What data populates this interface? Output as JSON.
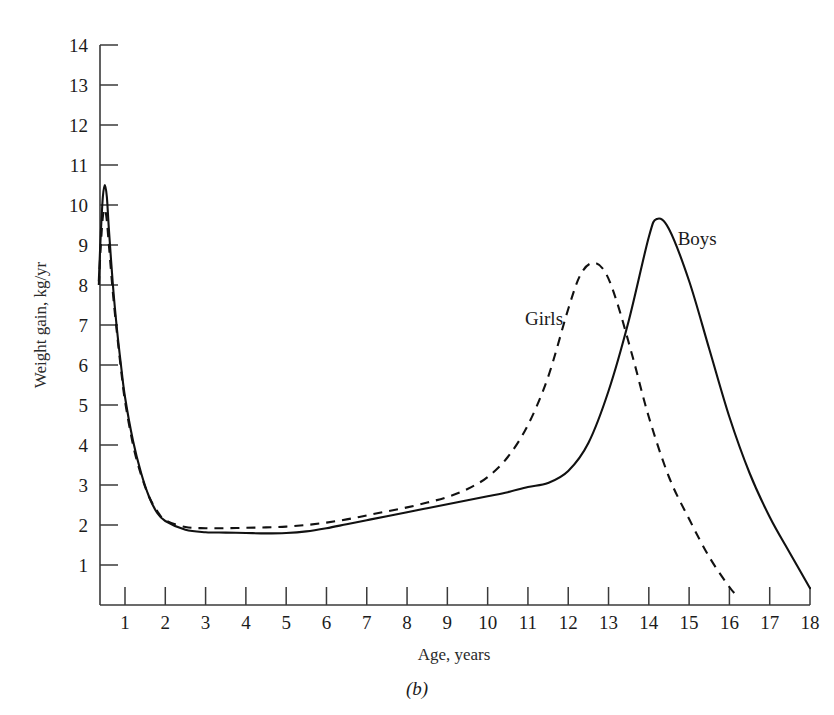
{
  "chart_data": {
    "type": "line",
    "title": "",
    "caption": "(b)",
    "xlabel": "Age, years",
    "ylabel": "Weight gain, kg/yr",
    "xlim": [
      0.3,
      18
    ],
    "ylim": [
      0,
      14
    ],
    "grid": false,
    "legend_position": "inline-annotations",
    "xticks": [
      1,
      2,
      3,
      4,
      5,
      6,
      7,
      8,
      9,
      10,
      11,
      12,
      13,
      14,
      15,
      16,
      17,
      18
    ],
    "xtick_labels": [
      "1",
      "2",
      "3",
      "4",
      "5",
      "6",
      "7",
      "8",
      "9",
      "10",
      "11",
      "12",
      "13",
      "14",
      "15",
      "16",
      "17",
      "18"
    ],
    "yticks": [
      1,
      2,
      3,
      4,
      5,
      6,
      7,
      8,
      9,
      10,
      11,
      12,
      13,
      14
    ],
    "ytick_labels": [
      "1",
      "2",
      "3",
      "4",
      "5",
      "6",
      "7",
      "8",
      "9",
      "10",
      "11",
      "12",
      "13",
      "14"
    ],
    "series": [
      {
        "name": "Boys",
        "style": "solid",
        "color": "#111111",
        "annotation": "Boys",
        "peak_age": 14.2,
        "peak_value": 9.65,
        "x": [
          0.35,
          0.4,
          0.45,
          0.5,
          0.55,
          0.6,
          0.7,
          0.8,
          0.9,
          1.0,
          1.2,
          1.4,
          1.6,
          1.8,
          2.0,
          2.5,
          3.0,
          3.5,
          4.0,
          4.5,
          5.0,
          5.5,
          6.0,
          6.5,
          7.0,
          7.5,
          8.0,
          8.5,
          9.0,
          9.5,
          10.0,
          10.5,
          11.0,
          11.5,
          12.0,
          12.5,
          13.0,
          13.5,
          14.0,
          14.2,
          14.5,
          15.0,
          15.5,
          16.0,
          16.5,
          17.0,
          17.5,
          18.0
        ],
        "y": [
          8.1,
          9.3,
          10.2,
          10.5,
          10.2,
          9.4,
          8.0,
          6.9,
          6.0,
          5.2,
          4.1,
          3.3,
          2.7,
          2.3,
          2.1,
          1.88,
          1.82,
          1.81,
          1.8,
          1.79,
          1.8,
          1.84,
          1.92,
          2.02,
          2.12,
          2.22,
          2.32,
          2.42,
          2.52,
          2.62,
          2.72,
          2.82,
          2.95,
          3.05,
          3.35,
          4.05,
          5.35,
          7.1,
          9.2,
          9.65,
          9.4,
          8.1,
          6.4,
          4.7,
          3.3,
          2.2,
          1.3,
          0.42
        ]
      },
      {
        "name": "Girls",
        "style": "dashed",
        "color": "#111111",
        "annotation": "Girls",
        "peak_age": 12.6,
        "peak_value": 8.55,
        "x": [
          0.35,
          0.4,
          0.45,
          0.5,
          0.55,
          0.6,
          0.7,
          0.8,
          0.9,
          1.0,
          1.2,
          1.4,
          1.6,
          1.8,
          2.0,
          2.5,
          3.0,
          3.5,
          4.0,
          4.5,
          5.0,
          5.5,
          6.0,
          6.5,
          7.0,
          7.5,
          8.0,
          8.5,
          9.0,
          9.5,
          10.0,
          10.5,
          11.0,
          11.5,
          12.0,
          12.3,
          12.6,
          12.9,
          13.2,
          13.6,
          14.0,
          14.5,
          15.0,
          15.5,
          16.0,
          16.2
        ],
        "y": [
          8.0,
          9.0,
          9.7,
          9.9,
          9.6,
          9.0,
          7.8,
          6.8,
          5.9,
          5.1,
          4.0,
          3.25,
          2.7,
          2.35,
          2.12,
          1.95,
          1.92,
          1.92,
          1.93,
          1.94,
          1.96,
          2.0,
          2.06,
          2.14,
          2.24,
          2.34,
          2.44,
          2.56,
          2.7,
          2.9,
          3.2,
          3.7,
          4.5,
          5.7,
          7.4,
          8.25,
          8.55,
          8.35,
          7.6,
          6.2,
          4.7,
          3.2,
          2.15,
          1.2,
          0.45,
          0.22
        ]
      }
    ],
    "annotations": [
      {
        "text": "Girls",
        "x": 11.4,
        "y": 7.0
      },
      {
        "text": "Boys",
        "x": 15.2,
        "y": 9.0
      }
    ]
  }
}
